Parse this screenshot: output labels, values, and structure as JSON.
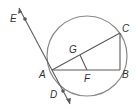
{
  "diagram": {
    "type": "circle-geometry",
    "colors": {
      "stroke": "#5a5a5a",
      "circle": "#8a8a8a",
      "label": "#333333"
    },
    "circle": {
      "cx": 87,
      "cy": 56,
      "r": 40
    },
    "points": {
      "A": {
        "label": "A",
        "x": 52,
        "y": 70
      },
      "B": {
        "label": "B",
        "x": 120,
        "y": 70
      },
      "C": {
        "label": "C",
        "x": 120,
        "y": 33
      },
      "D": {
        "label": "D",
        "x": 63,
        "y": 90
      },
      "E": {
        "label": "E",
        "x": 25,
        "y": 20
      },
      "F": {
        "label": "F",
        "x": 87,
        "y": 70
      },
      "G": {
        "label": "G",
        "x": 80,
        "y": 53
      }
    },
    "segments": [
      "AB",
      "AC",
      "BC",
      "GF"
    ],
    "tangent_line": {
      "through": "A",
      "points": [
        "E",
        "D"
      ],
      "arrows": true
    }
  }
}
